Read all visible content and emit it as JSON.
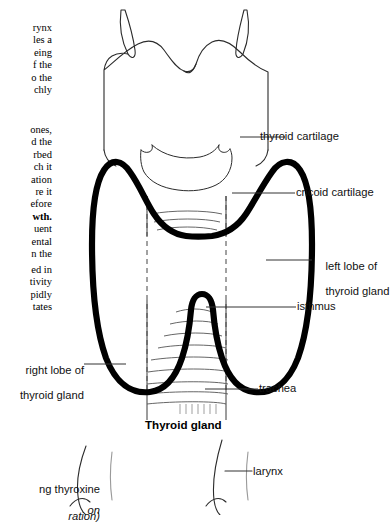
{
  "page": {
    "width": 384,
    "height": 515,
    "background": "#ffffff",
    "ink": "#111111"
  },
  "body_text": {
    "block_1": {
      "name": "truncated-paragraph-1",
      "lines": [
        "rynx",
        "les a",
        "eing",
        "f the",
        "o the",
        "chly"
      ]
    },
    "block_2": {
      "name": "truncated-paragraph-2",
      "lines": [
        "ones,",
        "d the",
        "rbed",
        "ch it",
        "ation",
        "re it",
        "efore"
      ],
      "bold_line": "wth.",
      "lines_after": [
        "uent",
        "ental",
        "n the"
      ]
    },
    "block_3": {
      "name": "truncated-paragraph-3",
      "lines": [
        "ed in",
        "tivity",
        "pidly",
        "tates"
      ]
    }
  },
  "figure": {
    "caption": "Thyroid gland",
    "labels": {
      "thyroid_cartilage": "thyroid cartilage",
      "cricoid_cartilage": "cricoid cartilage",
      "left_lobe_line1": "left lobe of",
      "left_lobe_line2": "thyroid gland",
      "isthmus": "isthmus",
      "trachea": "trachea",
      "right_lobe_line1": "right lobe of",
      "right_lobe_line2": "thyroid gland"
    },
    "colors": {
      "gland_outline": "#000000",
      "cartilage_outline": "#2b2b2b",
      "leader_line": "#333333",
      "dashed_guide": "#444444"
    },
    "gland_stroke_width": 6,
    "cartilage_stroke_width": 1
  },
  "figure_2": {
    "label_larynx": "larynx",
    "footnote_line1": "ng thyroxine",
    "footnote_line2": "ration)",
    "footnote_italic": "on"
  }
}
